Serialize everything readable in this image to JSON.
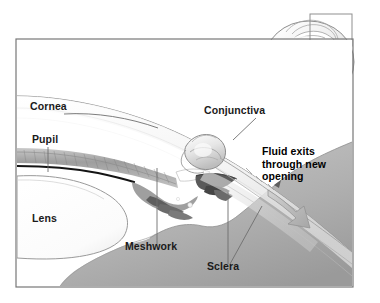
{
  "figure": {
    "frame": {
      "x": 16,
      "y": 39,
      "width": 337,
      "height": 248,
      "border_color": "#777777"
    },
    "background_color": "#ffffff",
    "ink_color": "#1a1a1a",
    "shade_color": "#b9b9b9"
  },
  "labels": [
    {
      "id": "cornea",
      "text": "Cornea",
      "x": 30,
      "y": 110,
      "bold": false
    },
    {
      "id": "pupil",
      "text": "Pupil",
      "x": 32,
      "y": 143,
      "bold": false
    },
    {
      "id": "lens",
      "text": "Lens",
      "x": 32,
      "y": 222,
      "bold": false
    },
    {
      "id": "conjunctiva",
      "text": "Conjunctiva",
      "x": 204,
      "y": 114,
      "bold": false
    },
    {
      "id": "meshwork",
      "text": "Meshwork",
      "x": 125,
      "y": 250,
      "bold": false
    },
    {
      "id": "sclera",
      "text": "Sclera",
      "x": 207,
      "y": 270,
      "bold": false
    }
  ],
  "callout": {
    "id": "fluid-exits-callout",
    "lines": [
      "Fluid exits",
      "through new",
      "opening"
    ],
    "x": 262,
    "y": 155,
    "line_height": 12.5,
    "bold": true
  },
  "inset": {
    "id": "whole-eye-inset",
    "label": "whole eyeball reference view",
    "globe_center_x": 309,
    "globe_center_y": 62,
    "globe_rx": 45,
    "globe_ry": 41,
    "highlight_box": {
      "x": 310,
      "y": 14,
      "width": 42,
      "height": 32
    }
  },
  "structures": [
    {
      "id": "cornea-band",
      "name": "cornea"
    },
    {
      "id": "iris-band",
      "name": "iris"
    },
    {
      "id": "pupil-edge",
      "name": "pupil margin"
    },
    {
      "id": "lens-body",
      "name": "lens"
    },
    {
      "id": "trabecular-meshwork",
      "name": "trabecular meshwork"
    },
    {
      "id": "sclera-mass",
      "name": "sclera"
    },
    {
      "id": "conjunctiva-flap",
      "name": "conjunctival flap"
    },
    {
      "id": "flow-arrow",
      "name": "aqueous outflow arrow"
    }
  ]
}
